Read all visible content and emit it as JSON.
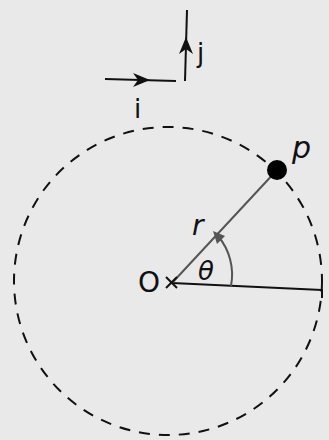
{
  "diagram": {
    "labels": {
      "unit_i": "i",
      "unit_j": "j",
      "point": "p",
      "radius": "r",
      "angle": "θ",
      "origin": "O"
    },
    "elements": {
      "circle": {
        "style": "dashed",
        "cx": 168,
        "cy": 281,
        "r": 154
      },
      "origin": {
        "x": 172,
        "y": 283,
        "marker": "cross"
      },
      "particle": {
        "x": 277,
        "y": 170,
        "fill": "#000000"
      },
      "reference_line": {
        "from": [
          172,
          283
        ],
        "to": [
          322,
          290
        ]
      },
      "radius_line": {
        "from": [
          172,
          283
        ],
        "to": [
          277,
          170
        ],
        "color": "#555555"
      },
      "angle_arc": {
        "color": "#555555",
        "arrow": "counterclockwise"
      }
    },
    "colors": {
      "background": "#e9e9e9",
      "ink": "#111111",
      "secondary": "#555555"
    }
  }
}
